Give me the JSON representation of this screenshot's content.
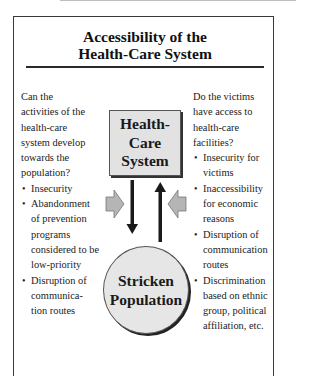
{
  "title": {
    "line1": "Accessibility of the",
    "line2": "Health-Care System"
  },
  "left_column": {
    "question": [
      "Can the",
      "activities of the",
      "health-care",
      "system develop",
      "towards the",
      "population?"
    ],
    "bullets": [
      "Insecurity",
      "Abandonment of prevention programs considered to be low-priority",
      "Disruption of communica-tion routes"
    ]
  },
  "right_column": {
    "question": [
      "Do the victims",
      "have access to",
      "health-care",
      "facilities?"
    ],
    "bullets": [
      "Insecurity for victims",
      "Inaccessibility for economic reasons",
      "Disruption of communication routes",
      "Discrimination based on ethnic group, political affiliation, etc."
    ]
  },
  "nodes": {
    "health_care_system": [
      "Health-",
      "Care",
      "System"
    ],
    "stricken_population": [
      "Stricken",
      "Population"
    ]
  },
  "arrows": {
    "down": "health-care system to population",
    "up": "population to health-care system",
    "side_left": "pressure from left",
    "side_right": "pressure from right"
  },
  "colors": {
    "box_fill": "#e2e2e2",
    "circle_fill": "#e6e6e6",
    "side_arrow_fill": "#b5b5b5",
    "arrow_dark": "#1a1a1a"
  }
}
